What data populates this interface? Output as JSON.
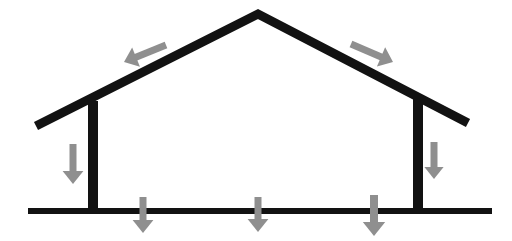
{
  "diagram": {
    "type": "structural-section",
    "background_color": "#ffffff",
    "structure_color": "#121212",
    "force_arrow_color": "#8f8f8f",
    "canvas": {
      "width": 512,
      "height": 241
    },
    "structure": {
      "roof": {
        "name": "gable-roof",
        "apex": {
          "x": 258,
          "y": 14
        },
        "left_eave_tip": {
          "x": 36,
          "y": 126
        },
        "right_eave_tip": {
          "x": 468,
          "y": 123
        },
        "thickness": 9
      },
      "columns": [
        {
          "name": "left-column",
          "x": 93,
          "top_y": 101,
          "bottom_y": 212,
          "thickness": 10
        },
        {
          "name": "right-column",
          "x": 418,
          "top_y": 99,
          "bottom_y": 212,
          "thickness": 10
        }
      ],
      "ground_line": {
        "name": "foundation-line",
        "x1": 28,
        "x2": 492,
        "y": 211,
        "thickness": 6
      }
    },
    "forces": [
      {
        "name": "roof-load-left",
        "label": "left roof slope load",
        "direction": "left-down",
        "tail": {
          "x": 166,
          "y": 45
        },
        "head": {
          "x": 124,
          "y": 62
        },
        "shaft_width": 7,
        "head_size": 13
      },
      {
        "name": "roof-load-right",
        "label": "right roof slope load",
        "direction": "right-down",
        "tail": {
          "x": 351,
          "y": 44
        },
        "head": {
          "x": 393,
          "y": 62
        },
        "shaft_width": 7,
        "head_size": 13
      },
      {
        "name": "column-load-left",
        "label": "left column axial load",
        "direction": "down",
        "tail": {
          "x": 73,
          "y": 144
        },
        "head": {
          "x": 73,
          "y": 184
        },
        "shaft_width": 7,
        "head_size": 13
      },
      {
        "name": "column-load-right",
        "label": "right column axial load",
        "direction": "down",
        "tail": {
          "x": 434,
          "y": 142
        },
        "head": {
          "x": 434,
          "y": 179
        },
        "shaft_width": 7,
        "head_size": 12
      },
      {
        "name": "ground-reaction-1",
        "label": "foundation bearing pressure 1",
        "direction": "down",
        "tail": {
          "x": 143,
          "y": 197
        },
        "head": {
          "x": 143,
          "y": 233
        },
        "shaft_width": 7,
        "head_size": 13
      },
      {
        "name": "ground-reaction-2",
        "label": "foundation bearing pressure 2",
        "direction": "down",
        "tail": {
          "x": 258,
          "y": 197
        },
        "head": {
          "x": 258,
          "y": 232
        },
        "shaft_width": 7,
        "head_size": 13
      },
      {
        "name": "ground-reaction-3",
        "label": "foundation bearing pressure 3",
        "direction": "down",
        "tail": {
          "x": 374,
          "y": 195
        },
        "head": {
          "x": 374,
          "y": 236
        },
        "shaft_width": 8,
        "head_size": 14
      }
    ]
  }
}
